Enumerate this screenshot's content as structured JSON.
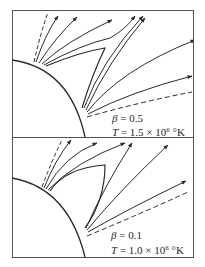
{
  "figure": {
    "colors": {
      "line": "#2a2a2a",
      "background": "#ffffff",
      "frame": "#555555"
    },
    "panels": [
      {
        "id": "top",
        "beta_symbol": "β",
        "beta_value": "0.5",
        "beta_label": "β = 0.5",
        "temp_symbol": "T",
        "temp_eq": " = 1.5 × 10",
        "temp_exp": "6",
        "temp_unit": " °K",
        "features": [
          "solar-limb-arc",
          "closed-helmet-streamer-cusp",
          "open-field-lines-with-arrows",
          "dashed-boundary-lines"
        ]
      },
      {
        "id": "bottom",
        "beta_symbol": "β",
        "beta_value": "0.1",
        "beta_label": "β = 0.1",
        "temp_symbol": "T",
        "temp_eq": " = 1.0 × 10",
        "temp_exp": "6",
        "temp_unit": " °K",
        "features": [
          "solar-limb-arc",
          "closed-helmet-streamer-cusp",
          "open-field-lines-with-arrows",
          "dashed-boundary-lines"
        ]
      }
    ]
  }
}
